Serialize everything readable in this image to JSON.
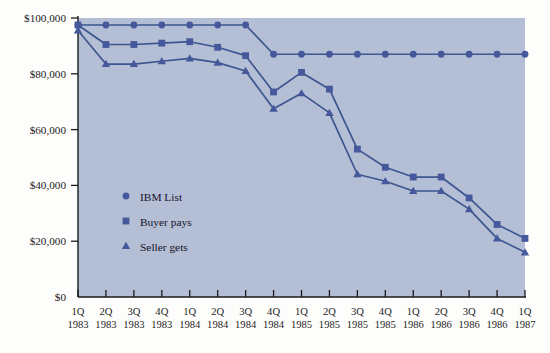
{
  "chart_data": {
    "type": "line",
    "title": "",
    "subtitle": "",
    "xlabel": "",
    "ylabel": "",
    "grid": false,
    "legend_position": "inside-left-lower",
    "ylim": [
      0,
      100000
    ],
    "y_ticks": [
      0,
      20000,
      40000,
      60000,
      80000,
      100000
    ],
    "y_tick_labels": [
      "$0",
      "$20,000",
      "$40,000",
      "$60,000",
      "$80,000",
      "$100,000"
    ],
    "categories": [
      "1Q 1983",
      "2Q 1983",
      "3Q 1983",
      "4Q 1983",
      "1Q 1984",
      "2Q 1984",
      "3Q 1984",
      "4Q 1984",
      "1Q 1985",
      "2Q 1985",
      "3Q 1985",
      "4Q 1985",
      "1Q 1986",
      "2Q 1986",
      "3Q 1986",
      "4Q 1986",
      "1Q 1987"
    ],
    "x_tick_quarters": [
      "1Q",
      "2Q",
      "3Q",
      "4Q",
      "1Q",
      "2Q",
      "3Q",
      "4Q",
      "1Q",
      "2Q",
      "3Q",
      "4Q",
      "1Q",
      "2Q",
      "3Q",
      "4Q",
      "1Q"
    ],
    "x_tick_years": [
      "1983",
      "1983",
      "1983",
      "1983",
      "1984",
      "1984",
      "1984",
      "1984",
      "1985",
      "1985",
      "1985",
      "1985",
      "1986",
      "1986",
      "1986",
      "1986",
      "1987"
    ],
    "series": [
      {
        "name": "IBM List",
        "marker": "circle",
        "color": "#3d5590",
        "values": [
          97500,
          97500,
          97500,
          97500,
          97500,
          97500,
          97500,
          87000,
          87000,
          87000,
          87000,
          87000,
          87000,
          87000,
          87000,
          87000,
          87000
        ]
      },
      {
        "name": "Buyer pays",
        "marker": "square",
        "color": "#3d5590",
        "values": [
          97500,
          90500,
          90500,
          91000,
          91500,
          89500,
          86500,
          73500,
          80500,
          74500,
          53000,
          46500,
          43000,
          43000,
          35500,
          26000,
          21000
        ]
      },
      {
        "name": "Seller gets",
        "marker": "triangle",
        "color": "#3d5590",
        "values": [
          95500,
          83500,
          83500,
          84500,
          85500,
          84000,
          81000,
          67500,
          73000,
          66000,
          44000,
          41500,
          38000,
          38000,
          31500,
          21000,
          16000
        ]
      }
    ]
  },
  "legend": {
    "items": [
      {
        "label": "IBM List",
        "marker": "circle"
      },
      {
        "label": "Buyer pays",
        "marker": "square"
      },
      {
        "label": "Seller gets",
        "marker": "triangle"
      }
    ]
  },
  "colors": {
    "plot_background": "#b4bed4",
    "series_blue": "#3d5590",
    "marker_blue": "#44589b",
    "axis_black": "#1a1a1a",
    "page_background": "#fdfdfb",
    "label_text": "#1d1d1f"
  }
}
